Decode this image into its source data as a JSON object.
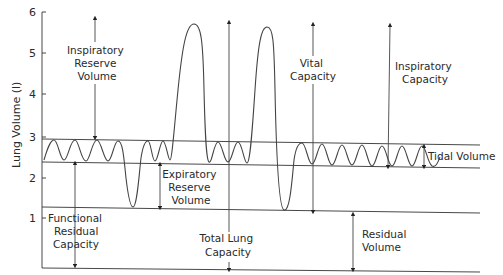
{
  "diagram": {
    "y_axis": {
      "title": "Lung Volume (l)",
      "ticks": [
        "1",
        "2",
        "3",
        "4",
        "5",
        "6"
      ]
    },
    "labels": {
      "irv": [
        "Inspiratory",
        "Reserve",
        "Volume"
      ],
      "frc": [
        "Functional",
        "Residual",
        "Capacity"
      ],
      "erv": [
        "Expiratory",
        "Reserve",
        "Volume"
      ],
      "tlc": [
        "Total Lung",
        "Capacity"
      ],
      "vc": [
        "Vital",
        "Capacity"
      ],
      "ic": [
        "Inspiratory",
        "Capacity"
      ],
      "tv": "Tidal Volume",
      "rv": [
        "Residual",
        "Volume"
      ]
    },
    "colors": {
      "line": "#333333",
      "text": "#2a2a2a",
      "background": "#ffffff"
    }
  }
}
